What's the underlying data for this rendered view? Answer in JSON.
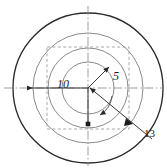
{
  "figure": {
    "background_color": "#ffffff",
    "width": 167,
    "height": 168,
    "center": {
      "x": 88,
      "y": 88
    },
    "outer_circle_color": "#2b2b2b",
    "inner_circle_color": "#8a8a8a",
    "dashed_square_color": "#9a9a9a",
    "centerline_color": "#8f8f8f",
    "dimension_line_color": "#3a3a3a",
    "circles": [
      {
        "name": "outer-circle",
        "radius": 75,
        "stroke": "#2b2b2b",
        "stroke_width": 1.3,
        "style": "solid"
      },
      {
        "name": "second-circle",
        "radius": 55,
        "stroke": "#8a8a8a",
        "stroke_width": 1.0,
        "style": "solid"
      },
      {
        "name": "third-circle",
        "radius": 40,
        "stroke": "#8a8a8a",
        "stroke_width": 1.0,
        "style": "solid"
      },
      {
        "name": "inner-circle",
        "radius": 26,
        "stroke": "#8a8a8a",
        "stroke_width": 1.0,
        "style": "solid"
      }
    ],
    "dashed_square": {
      "name": "dashed-square",
      "half_size": 41,
      "style": "dashed"
    },
    "centerlines": [
      {
        "name": "horizontal-centerline",
        "orientation": "horizontal",
        "style": "dash-dot"
      },
      {
        "name": "vertical-centerline",
        "orientation": "vertical",
        "style": "dash-dot"
      }
    ],
    "dimensions": [
      {
        "name": "radius-dimension-10",
        "label": "10",
        "value": 10,
        "direction": "left",
        "arrowhead": "left-filled",
        "from": {
          "x": 88,
          "y": 88
        },
        "to": {
          "x": 24,
          "y": 88
        }
      },
      {
        "name": "radius-dimension-5",
        "label": "5",
        "value": 5,
        "direction": "up-right",
        "arrowhead": "up-right-filled",
        "from": {
          "x": 88,
          "y": 88
        },
        "to": {
          "x": 110,
          "y": 66
        }
      },
      {
        "name": "radius-dimension-down",
        "label": "",
        "value": null,
        "direction": "down",
        "arrowhead": "down-filled",
        "from": {
          "x": 88,
          "y": 88
        },
        "to": {
          "x": 88,
          "y": 126
        }
      },
      {
        "name": "leader-dimension-13",
        "label": "13",
        "value": 13,
        "direction": "down-right",
        "arrowhead": "down-left-filled",
        "from": {
          "x": 155,
          "y": 140
        },
        "to": {
          "x": 88,
          "y": 88
        }
      }
    ],
    "labels": {
      "radius_10": "10",
      "radius_5": "5",
      "leader_13": "13"
    }
  }
}
